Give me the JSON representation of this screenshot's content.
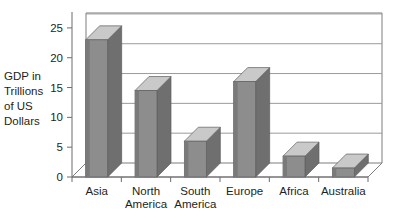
{
  "chart_data": {
    "type": "bar",
    "title": "",
    "subtitle": "",
    "xlabel": "",
    "ylabel": "GDP in Trillions of US Dollars",
    "ylabel_lines": [
      "GDP in",
      "Trillions",
      "of US",
      "Dollars"
    ],
    "categories": [
      "Asia",
      "North America",
      "South America",
      "Europe",
      "Africa",
      "Australia"
    ],
    "category_lines": [
      [
        "Asia"
      ],
      [
        "North",
        "America"
      ],
      [
        "South",
        "America"
      ],
      [
        "Europe"
      ],
      [
        "Africa"
      ],
      [
        "Australia"
      ]
    ],
    "values": [
      23,
      14.5,
      6,
      16,
      3.5,
      1.5
    ],
    "ylim": [
      0,
      27.5
    ],
    "yticks": [
      0,
      5,
      10,
      15,
      20,
      25
    ],
    "ytick_labels": [
      "0",
      "5",
      "10",
      "15",
      "20",
      "25"
    ],
    "grid": true,
    "grid_axis": "y",
    "legend": "none",
    "style": "3d-column",
    "colors": {
      "bar_face": "#8d8d8d",
      "bar_top": "#c9c9c9",
      "bar_side": "#6f6f6f",
      "grid": "#9b9b9b",
      "axis": "#6d6d6d",
      "floor": "#ffffff",
      "background": "#ffffff",
      "text": "#231f20"
    }
  }
}
